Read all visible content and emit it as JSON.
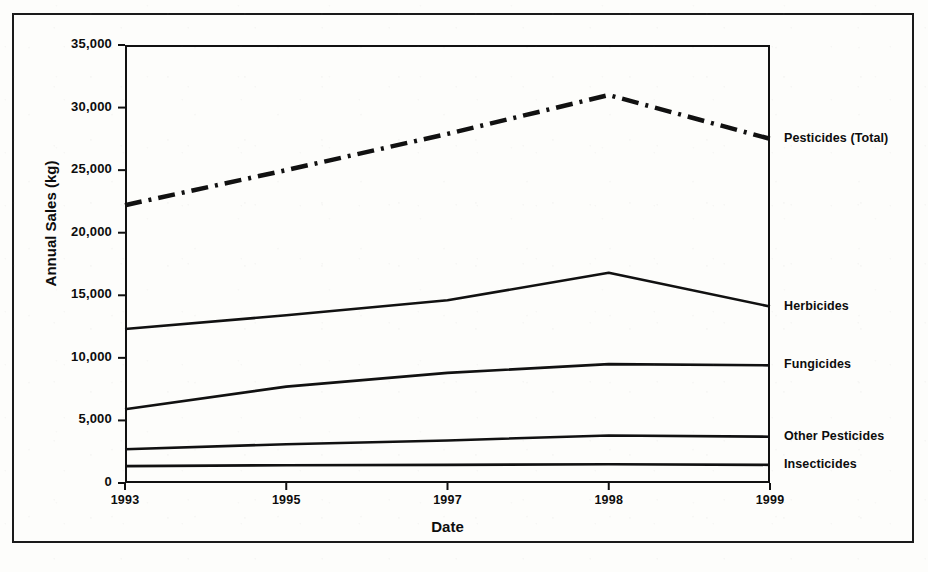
{
  "chart_data": {
    "type": "line",
    "title": "",
    "xlabel": "Date",
    "ylabel": "Annual Sales (kg)",
    "categories": [
      "1993",
      "1995",
      "1997",
      "1998",
      "1999"
    ],
    "ylim": [
      0,
      35000
    ],
    "yticks": [
      0,
      5000,
      10000,
      15000,
      20000,
      25000,
      30000,
      35000
    ],
    "ytick_labels": [
      "0",
      "5,000",
      "10,000",
      "15,000",
      "20,000",
      "25,000",
      "30,000",
      "35,000"
    ],
    "grid": false,
    "legend_position": "right-of-plot-at-line-end",
    "series": [
      {
        "name": "Pesticides (Total)",
        "style": "dash-dot",
        "color": "#111111",
        "values": [
          22200,
          25000,
          27900,
          31000,
          27500
        ]
      },
      {
        "name": "Herbicides",
        "style": "solid",
        "color": "#111111",
        "values": [
          12300,
          13400,
          14600,
          16800,
          14100
        ]
      },
      {
        "name": "Fungicides",
        "style": "solid",
        "color": "#111111",
        "values": [
          5900,
          7700,
          8800,
          9500,
          9400
        ]
      },
      {
        "name": "Other Pesticides",
        "style": "solid",
        "color": "#111111",
        "values": [
          2700,
          3100,
          3400,
          3800,
          3700
        ]
      },
      {
        "name": "Insecticides",
        "style": "solid",
        "color": "#111111",
        "values": [
          1350,
          1420,
          1450,
          1500,
          1450
        ]
      }
    ]
  }
}
